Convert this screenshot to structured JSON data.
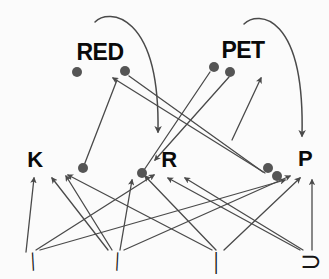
{
  "figure": {
    "background_color": "#fbfbfb",
    "ink_color": "#4a4a4a",
    "node_color": "#555555",
    "text_color": "#0a0a0a",
    "width": 329,
    "height": 279
  },
  "levels": {
    "word_level_label": "word level",
    "letter_level_label": "letter level",
    "feature_level_label": "feature level"
  },
  "word_nodes": [
    {
      "id": "red",
      "label": "RED",
      "x": 100,
      "y": 52,
      "font_size": 23
    },
    {
      "id": "pet",
      "label": "PET",
      "x": 243,
      "y": 50,
      "font_size": 23
    }
  ],
  "letter_nodes": [
    {
      "id": "k",
      "label": "K",
      "x": 35,
      "y": 160,
      "font_size": 22
    },
    {
      "id": "r",
      "label": "R",
      "x": 169,
      "y": 160,
      "font_size": 22
    },
    {
      "id": "p",
      "label": "P",
      "x": 305,
      "y": 159,
      "font_size": 22
    }
  ],
  "feature_marks": [
    {
      "id": "slash",
      "glyph": "/",
      "x": 33,
      "y": 262,
      "rotation": -22,
      "font_size": 26
    },
    {
      "id": "backslash",
      "glyph": "\\",
      "x": 117,
      "y": 262,
      "rotation": 22,
      "font_size": 26
    },
    {
      "id": "vertical-bar",
      "glyph": "|",
      "x": 216,
      "y": 261,
      "rotation": 0,
      "font_size": 26
    },
    {
      "id": "right-bracket",
      "glyph": "⊃",
      "x": 311,
      "y": 262,
      "rotation": 0,
      "font_size": 26
    }
  ],
  "dots": [
    {
      "id": "dot-red-left",
      "cx": 77,
      "cy": 72,
      "r": 5.0
    },
    {
      "id": "dot-red-right",
      "cx": 125,
      "cy": 71,
      "r": 5.0
    },
    {
      "id": "dot-pet-left",
      "cx": 214,
      "cy": 67,
      "r": 5.0
    },
    {
      "id": "dot-pet-right",
      "cx": 230,
      "cy": 72,
      "r": 5.0
    },
    {
      "id": "dot-k-right",
      "cx": 83,
      "cy": 168,
      "r": 5.0
    },
    {
      "id": "dot-r-left",
      "cx": 142,
      "cy": 173,
      "r": 5.0
    },
    {
      "id": "dot-p-left",
      "cx": 268,
      "cy": 168,
      "r": 5.0
    },
    {
      "id": "dot-p-left2",
      "cx": 277,
      "cy": 176,
      "r": 5.0
    }
  ],
  "arrows_letter_to_word": [
    {
      "id": "k-to-red",
      "from": [
        83,
        168
      ],
      "to": [
        117,
        80
      ],
      "head": false,
      "note": "K node up to RED left dot region"
    },
    {
      "id": "r-to-pet",
      "from": [
        142,
        173
      ],
      "to": [
        210,
        72
      ],
      "head": false,
      "note": "R node up to PET left dot"
    },
    {
      "id": "pet-to-r",
      "from": [
        229,
        77
      ],
      "to": [
        155,
        160
      ],
      "head": true,
      "note": "PET right dot down to R, arrowhead at R"
    },
    {
      "id": "red-to-p",
      "from": [
        129,
        76
      ],
      "to": [
        263,
        172
      ],
      "head": false,
      "note": "RED right dot down toward P dot"
    },
    {
      "id": "p-to-red",
      "from": [
        265,
        173
      ],
      "to": [
        113,
        78
      ],
      "head": true,
      "note": "rising line arrowhead near RED"
    },
    {
      "id": "up-to-pet",
      "from": [
        232,
        140
      ],
      "to": [
        261,
        78
      ],
      "head": true,
      "note": "arrowhead pointing up at PET right"
    }
  ],
  "curved_arrows": [
    {
      "id": "red-inhibit-curve",
      "start": [
        95,
        22
      ],
      "c1": [
        108,
        8
      ],
      "c2": [
        160,
        12
      ],
      "end": [
        158,
        132
      ],
      "head": true
    },
    {
      "id": "pet-inhibit-curve",
      "start": [
        244,
        24
      ],
      "c1": [
        258,
        10
      ],
      "c2": [
        305,
        14
      ],
      "end": [
        302,
        136
      ],
      "head": true
    }
  ],
  "arrows_feature_to_letter": [
    {
      "id": "f1-to-k",
      "from": [
        26,
        252
      ],
      "to": [
        34,
        178
      ],
      "head": true
    },
    {
      "id": "f1-to-r",
      "from": [
        36,
        250
      ],
      "to": [
        154,
        175
      ],
      "head": true
    },
    {
      "id": "f1-to-p",
      "from": [
        40,
        250
      ],
      "to": [
        285,
        180
      ],
      "head": true
    },
    {
      "id": "f2-to-k",
      "from": [
        108,
        250
      ],
      "to": [
        52,
        178
      ],
      "head": true
    },
    {
      "id": "f2-to-kr",
      "from": [
        112,
        250
      ],
      "to": [
        66,
        176
      ],
      "head": true
    },
    {
      "id": "f2-to-p",
      "from": [
        124,
        250
      ],
      "to": [
        290,
        176
      ],
      "head": true
    },
    {
      "id": "f3-to-k",
      "from": [
        212,
        250
      ],
      "to": [
        68,
        175
      ],
      "head": true
    },
    {
      "id": "f3-to-r",
      "from": [
        216,
        250
      ],
      "to": [
        145,
        176
      ],
      "head": true
    },
    {
      "id": "f3-to-p",
      "from": [
        224,
        250
      ],
      "to": [
        300,
        178
      ],
      "head": true
    },
    {
      "id": "f4-to-r",
      "from": [
        300,
        250
      ],
      "to": [
        168,
        178
      ],
      "head": true
    },
    {
      "id": "f4-to-r2",
      "from": [
        303,
        250
      ],
      "to": [
        185,
        178
      ],
      "head": true
    },
    {
      "id": "f4-to-p",
      "from": [
        312,
        250
      ],
      "to": [
        312,
        180
      ],
      "head": true
    },
    {
      "id": "mid-to-r",
      "from": [
        120,
        250
      ],
      "to": [
        132,
        180
      ],
      "head": true
    }
  ]
}
